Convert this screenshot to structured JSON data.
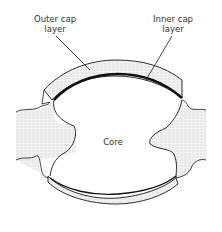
{
  "labels": {
    "outer_cap": "Outer cap layer",
    "outer_cap_line1": "Outer cap",
    "outer_cap_line2": "layer",
    "inner_cap_line1": "Inner cap",
    "inner_cap_line2": "layer",
    "core": "Core"
  },
  "colors": {
    "stroke": "#1a1a1a",
    "stipple": "#d9d9d9",
    "background": "#ffffff"
  }
}
